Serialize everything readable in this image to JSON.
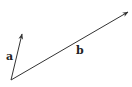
{
  "diagram": {
    "type": "vector-diagram",
    "colors": {
      "line": "#333333",
      "background": "#ffffff"
    },
    "origin": {
      "x": 11,
      "y": 80
    },
    "vectors": [
      {
        "label": "a",
        "end": {
          "x": 22,
          "y": 34
        },
        "label_pos": {
          "x": 6,
          "y": 60
        }
      },
      {
        "label": "b",
        "end": {
          "x": 128,
          "y": 12
        },
        "label_pos": {
          "x": 76,
          "y": 54
        }
      }
    ]
  }
}
